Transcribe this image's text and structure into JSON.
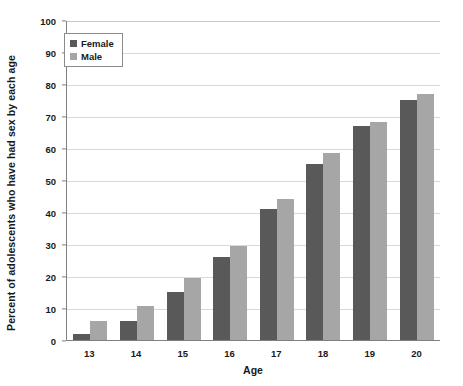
{
  "chart_data": {
    "type": "bar",
    "title": "",
    "xlabel": "Age",
    "ylabel": "Percent of adolescents who have had sex by each age",
    "categories": [
      "13",
      "14",
      "15",
      "16",
      "17",
      "18",
      "19",
      "20"
    ],
    "series": [
      {
        "name": "Female",
        "color": "#595959",
        "values": [
          2,
          6,
          15,
          26,
          41,
          55,
          67,
          75
        ]
      },
      {
        "name": "Male",
        "color": "#a6a6a6",
        "values": [
          6,
          10.5,
          19.5,
          29.5,
          44,
          58.5,
          68,
          77
        ]
      }
    ],
    "ylim": [
      0,
      100
    ],
    "ytick_values": [
      0,
      10,
      20,
      30,
      40,
      50,
      60,
      70,
      80,
      90,
      100
    ],
    "grid": true,
    "legend_position": "top-left"
  },
  "axes": {
    "y_title": "Percent of adolescents who have had sex by each age",
    "x_title": "Age",
    "y_ticks": [
      "100",
      "90",
      "80",
      "70",
      "60",
      "50",
      "40",
      "30",
      "20",
      "10",
      "0"
    ],
    "x_ticks": [
      "13",
      "14",
      "15",
      "16",
      "17",
      "18",
      "19",
      "20"
    ]
  },
  "legend": {
    "items": [
      {
        "label": "Female",
        "color": "#595959"
      },
      {
        "label": "Male",
        "color": "#a6a6a6"
      }
    ]
  },
  "colors": {
    "female": "#595959",
    "male": "#a6a6a6",
    "gridline": "#d9d9d9",
    "axis": "#808080",
    "text": "#1a1a1a",
    "background": "#ffffff"
  }
}
